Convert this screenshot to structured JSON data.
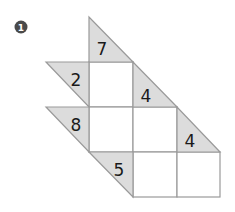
{
  "puzzle": {
    "number_badge": "1",
    "type": "cross-sums (kakuro-style) triangle clue puzzle",
    "grid": {
      "cols_x": [
        89,
        133,
        177,
        220
      ],
      "rows_y": [
        62,
        107,
        152,
        197
      ]
    },
    "clues": [
      {
        "id": "down-col1",
        "direction": "down",
        "value": "7"
      },
      {
        "id": "across-row1",
        "direction": "across",
        "value": "2"
      },
      {
        "id": "down-col2",
        "direction": "down",
        "value": "4"
      },
      {
        "id": "across-row2",
        "direction": "across",
        "value": "8"
      },
      {
        "id": "down-col3",
        "direction": "down",
        "value": "4"
      },
      {
        "id": "across-row3",
        "direction": "across",
        "value": "5"
      }
    ],
    "cells": [
      {
        "row": 1,
        "col": 1,
        "value": ""
      },
      {
        "row": 2,
        "col": 1,
        "value": ""
      },
      {
        "row": 2,
        "col": 2,
        "value": ""
      },
      {
        "row": 3,
        "col": 2,
        "value": ""
      },
      {
        "row": 3,
        "col": 3,
        "value": ""
      }
    ],
    "colors": {
      "clue_fill": "#dcdcdc",
      "line": "#9a9a9a",
      "cell_fill": "#ffffff",
      "text": "#1a1a1a",
      "badge": "#4a4a4a"
    }
  }
}
